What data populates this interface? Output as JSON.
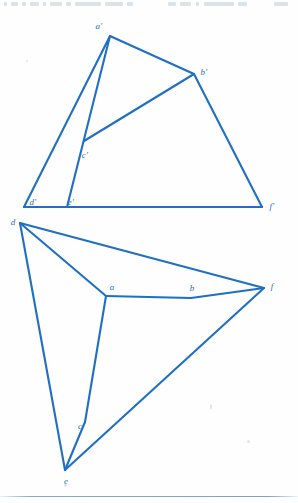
{
  "page": {
    "width": 298,
    "height": 503,
    "background_color": "#fefefe",
    "header_text": "",
    "footer_rule_color": "#5a8cc3"
  },
  "figure": {
    "caption": "",
    "stroke_color": "#1f6fc4",
    "stroke_width": 2.1,
    "label_color": "#2a6db5",
    "upper_figure": {
      "name": "primed-triangle-figure",
      "vertices": [
        {
          "id": "a-prime",
          "label": "a'",
          "x": 110,
          "y": 36,
          "label_x": 99,
          "label_y": 26
        },
        {
          "id": "b-prime",
          "label": "b'",
          "x": 194,
          "y": 74,
          "label_x": 204,
          "label_y": 72
        },
        {
          "id": "c-prime",
          "label": "c'",
          "x": 84,
          "y": 141,
          "label_x": 85,
          "label_y": 155
        },
        {
          "id": "d-prime",
          "label": "d'",
          "x": 24,
          "y": 207,
          "label_x": 33,
          "label_y": 202
        },
        {
          "id": "e-prime",
          "label": "e'",
          "x": 67,
          "y": 207,
          "label_x": 71,
          "label_y": 202
        },
        {
          "id": "f-prime",
          "label": "f'",
          "x": 262,
          "y": 207,
          "label_x": 272,
          "label_y": 206
        }
      ],
      "edges": [
        {
          "from": "a-prime",
          "to": "b-prime"
        },
        {
          "from": "a-prime",
          "to": "d-prime"
        },
        {
          "from": "a-prime",
          "to": "e-prime"
        },
        {
          "from": "b-prime",
          "to": "c-prime"
        },
        {
          "from": "b-prime",
          "to": "f-prime"
        },
        {
          "from": "d-prime",
          "to": "f-prime"
        }
      ]
    },
    "lower_figure": {
      "name": "unprimed-triangle-figure",
      "vertices": [
        {
          "id": "a",
          "label": "a",
          "x": 106,
          "y": 296,
          "label_x": 112,
          "label_y": 287
        },
        {
          "id": "b",
          "label": "b",
          "x": 191,
          "y": 298,
          "label_x": 192,
          "label_y": 288
        },
        {
          "id": "c",
          "label": "c",
          "x": 85,
          "y": 422,
          "label_x": 80,
          "label_y": 426
        },
        {
          "id": "d",
          "label": "d",
          "x": 20,
          "y": 223,
          "label_x": 13,
          "label_y": 222
        },
        {
          "id": "e",
          "label": "e",
          "x": 65,
          "y": 470,
          "label_x": 66,
          "label_y": 481
        },
        {
          "id": "f",
          "label": "f",
          "x": 264,
          "y": 288,
          "label_x": 272,
          "label_y": 286
        }
      ],
      "edges": [
        {
          "from": "d",
          "to": "f"
        },
        {
          "from": "d",
          "to": "a"
        },
        {
          "from": "d",
          "to": "e"
        },
        {
          "from": "a",
          "to": "b"
        },
        {
          "from": "b",
          "to": "f"
        },
        {
          "from": "a",
          "to": "c"
        },
        {
          "from": "c",
          "to": "e"
        },
        {
          "from": "e",
          "to": "f"
        }
      ]
    }
  }
}
